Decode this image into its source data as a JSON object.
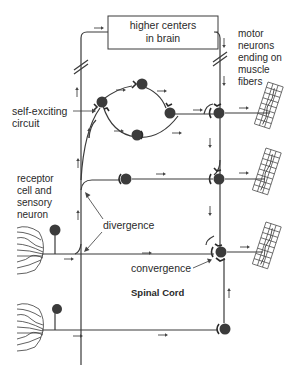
{
  "diagram": {
    "colors": {
      "background": "#ffffff",
      "line": "#3a3a3a",
      "soma": "#3b3b3b",
      "text": "#2a2a2a"
    },
    "labels": {
      "brain_box_line1": "higher centers",
      "brain_box_line2": "in brain",
      "motor_line1": "motor",
      "motor_line2": "neurons",
      "motor_line3": "ending on",
      "motor_line4": "muscle",
      "motor_line5": "fibers",
      "self_exciting_line1": "self-exciting",
      "self_exciting_line2": "circuit",
      "receptor_line1": "receptor",
      "receptor_line2": "cell and",
      "receptor_line3": "sensory",
      "receptor_line4": "neuron",
      "divergence": "divergence",
      "convergence": "convergence",
      "spinal_cord": "Spinal Cord"
    },
    "nodes": [
      {
        "id": "loop-top",
        "type": "neuron"
      },
      {
        "id": "loop-left",
        "type": "neuron"
      },
      {
        "id": "loop-right",
        "type": "neuron"
      },
      {
        "id": "loop-bottom",
        "type": "neuron"
      },
      {
        "id": "motor-1",
        "type": "motor-neuron"
      },
      {
        "id": "motor-2",
        "type": "motor-neuron"
      },
      {
        "id": "motor-3",
        "type": "motor-neuron"
      },
      {
        "id": "interneuron-middle",
        "type": "neuron"
      },
      {
        "id": "sensory-1",
        "type": "sensory-neuron"
      },
      {
        "id": "sensory-2",
        "type": "sensory-neuron"
      },
      {
        "id": "lower-interneuron",
        "type": "neuron"
      }
    ],
    "muscles": [
      {
        "id": "muscle-fiber-1"
      },
      {
        "id": "muscle-fiber-2"
      },
      {
        "id": "muscle-fiber-3"
      }
    ]
  }
}
